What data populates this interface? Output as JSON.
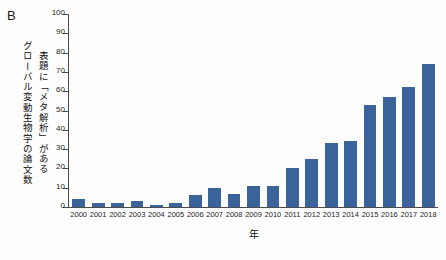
{
  "panel": {
    "letter": "B"
  },
  "chart_data": {
    "type": "bar",
    "title": "",
    "xlabel": "年",
    "ylabel_line1": "表題に「メタ解析」がある",
    "ylabel_line2": "グローバル変動生物学の論文数",
    "categories": [
      "2000",
      "2001",
      "2002",
      "2003",
      "2004",
      "2005",
      "2006",
      "2007",
      "2008",
      "2009",
      "2010",
      "2011",
      "2012",
      "2013",
      "2014",
      "2015",
      "2016",
      "2017",
      "2018"
    ],
    "values": [
      4,
      2,
      2,
      3,
      1,
      2,
      6,
      10,
      7,
      11,
      11,
      20,
      25,
      33,
      34,
      53,
      57,
      62,
      74
    ],
    "ylim": [
      0,
      100
    ],
    "yticks": [
      0,
      10,
      20,
      30,
      40,
      50,
      60,
      70,
      80,
      90,
      100
    ],
    "ytick_labels": [
      "0",
      "10",
      "20",
      "30",
      "40",
      "50",
      "60",
      "70",
      "80",
      "90",
      "100"
    ],
    "grid": false,
    "legend": false,
    "bar_color": "#3a6399",
    "axis_color": "#4b4b4b"
  }
}
